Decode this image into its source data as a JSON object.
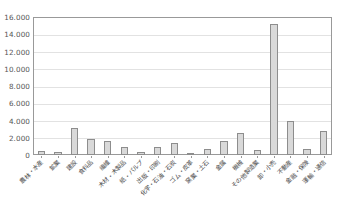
{
  "chart_data": {
    "type": "bar",
    "title": "",
    "xlabel": "",
    "ylabel": "",
    "ylim": [
      0,
      16000
    ],
    "ytick_step": 2000,
    "grid": true,
    "legend": "none",
    "bar_color": "#d9d9d9",
    "bar_border_color": "#8d8d8d",
    "gridline_color": "#e2e2e2",
    "axis_color": "#999999",
    "ytick_labels": [
      "16.000",
      "14.000",
      "12.000",
      "10.000",
      "8.000",
      "6.000",
      "4.000",
      "2.000",
      "0"
    ],
    "ytick_values": [
      16000,
      14000,
      12000,
      10000,
      8000,
      6000,
      4000,
      2000,
      0
    ],
    "categories": [
      "農林・水産",
      "鉱業",
      "建設",
      "食料品",
      "繊維",
      "木材・木製品",
      "紙・パルプ",
      "出版・印刷",
      "化学・石油・石炭",
      "ゴム・皮革",
      "窯業・土石",
      "金属",
      "機械",
      "その他製造業",
      "卸・小売",
      "不動産",
      "金融・保険",
      "運輸・通信"
    ],
    "values": [
      420,
      330,
      3150,
      1900,
      1650,
      900,
      370,
      900,
      1450,
      180,
      700,
      1600,
      2550,
      620,
      15200,
      3900,
      750,
      2800
    ]
  }
}
